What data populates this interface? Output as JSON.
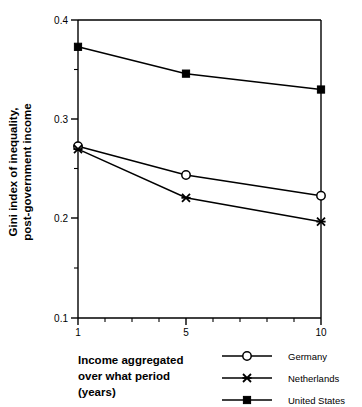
{
  "chart_data": {
    "type": "line",
    "title": "",
    "xlabel": "Income aggregated over what period (years)",
    "ylabel": "Gini index of inequality, post-government income",
    "x": [
      1,
      5,
      10
    ],
    "xticklabels": [
      "1",
      "5",
      "10"
    ],
    "yticklabels": [
      "0.1",
      "0.2",
      "0.3",
      "0.4"
    ],
    "xlim": [
      1,
      10
    ],
    "ylim": [
      0.1,
      0.4
    ],
    "grid": false,
    "legend_position": "bottom-right",
    "series": [
      {
        "name": "Germany",
        "marker": "open-circle",
        "values": [
          0.273,
          0.244,
          0.223
        ]
      },
      {
        "name": "Netherlands",
        "marker": "cross-star",
        "values": [
          0.27,
          0.221,
          0.197
        ]
      },
      {
        "name": "United States",
        "marker": "filled-square",
        "values": [
          0.373,
          0.346,
          0.33
        ]
      }
    ]
  },
  "axes": {
    "y_title_line1": "Gini index of inequality,",
    "y_title_line2": "post-government income",
    "x_title_line1": "Income aggregated",
    "x_title_line2": "over what period",
    "x_title_line3": "(years)",
    "y_ticks": [
      "0.4",
      "0.3",
      "0.2",
      "0.1"
    ],
    "x_ticks": [
      "1",
      "5",
      "10"
    ]
  },
  "legend": {
    "entries": [
      {
        "label": "Germany"
      },
      {
        "label": "Netherlands"
      },
      {
        "label": "United States"
      }
    ]
  },
  "colors": {
    "line": "#000000",
    "axis": "#000000",
    "background": "#ffffff"
  }
}
